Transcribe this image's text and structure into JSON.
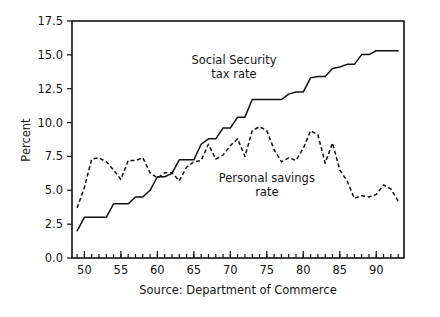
{
  "chart_data": {
    "type": "line",
    "title": "",
    "xlabel": "",
    "ylabel": "Percent",
    "source_note": "Source: Department of Commerce",
    "xlim": [
      48.3,
      93.8
    ],
    "ylim": [
      0.0,
      17.5
    ],
    "grid": false,
    "legend_position": "inline-annotations",
    "x_tick_labels": [
      "50",
      "55",
      "60",
      "65",
      "70",
      "75",
      "80",
      "85",
      "90"
    ],
    "x_tick_values": [
      50,
      55,
      60,
      65,
      70,
      75,
      80,
      85,
      90
    ],
    "x_minor_step": 1,
    "y_tick_labels": [
      "0.0",
      "2.5",
      "5.0",
      "7.5",
      "10.0",
      "12.5",
      "15.0",
      "17.5"
    ],
    "y_tick_values": [
      0.0,
      2.5,
      5.0,
      7.5,
      10.0,
      12.5,
      15.0,
      17.5
    ],
    "annotations": [
      {
        "name": "social-security-label",
        "text_line1": "Social Security",
        "text_line2": "tax rate",
        "x": 70.5,
        "y": 14.3
      },
      {
        "name": "personal-savings-label",
        "text_line1": "Personal savings",
        "text_line2": "rate",
        "x": 75.0,
        "y": 5.6
      }
    ],
    "x": [
      49,
      50,
      51,
      52,
      53,
      54,
      55,
      56,
      57,
      58,
      59,
      60,
      61,
      62,
      63,
      64,
      65,
      66,
      67,
      68,
      69,
      70,
      71,
      72,
      73,
      74,
      75,
      76,
      77,
      78,
      79,
      80,
      81,
      82,
      83,
      84,
      85,
      86,
      87,
      88,
      89,
      90,
      91,
      92,
      93
    ],
    "series": [
      {
        "name": "Social Security tax rate",
        "style": "solid",
        "values": [
          2.0,
          3.0,
          3.0,
          3.0,
          3.0,
          4.0,
          4.0,
          4.0,
          4.5,
          4.5,
          5.0,
          6.0,
          6.0,
          6.25,
          7.25,
          7.25,
          7.25,
          8.4,
          8.8,
          8.8,
          9.6,
          9.6,
          10.4,
          10.4,
          11.7,
          11.7,
          11.7,
          11.7,
          11.7,
          12.1,
          12.26,
          12.26,
          13.3,
          13.4,
          13.4,
          14.0,
          14.1,
          14.3,
          14.3,
          15.02,
          15.02,
          15.3,
          15.3,
          15.3,
          15.3
        ]
      },
      {
        "name": "Personal savings rate",
        "style": "dashed",
        "values": [
          3.7,
          5.2,
          7.3,
          7.4,
          7.1,
          6.5,
          5.8,
          7.2,
          7.2,
          7.4,
          6.3,
          5.9,
          6.3,
          6.3,
          5.7,
          6.7,
          7.1,
          7.2,
          8.4,
          7.3,
          7.6,
          8.3,
          8.8,
          7.5,
          9.4,
          9.7,
          9.4,
          8.0,
          7.1,
          7.4,
          7.2,
          8.1,
          9.4,
          9.1,
          7.0,
          8.5,
          6.5,
          5.7,
          4.4,
          4.6,
          4.5,
          4.7,
          5.4,
          5.1,
          4.2
        ]
      }
    ]
  },
  "figure": {
    "plot_left_px": 72,
    "plot_right_px": 404,
    "plot_top_px": 21,
    "plot_bottom_px": 258
  }
}
